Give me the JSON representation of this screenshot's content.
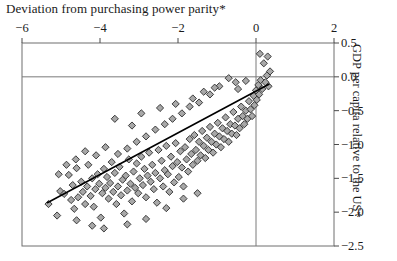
{
  "chart_data": {
    "type": "scatter",
    "title": "Deviation from purchasing power parity*",
    "xlabel": "Deviation from purchasing power parity*",
    "ylabel": "GDP per capita relative to the US*",
    "xlim": [
      -6,
      2
    ],
    "ylim": [
      -2.5,
      0.5
    ],
    "xticks": [
      -6,
      -4,
      -2,
      0,
      2
    ],
    "xtick_labels": [
      "−6",
      "−4",
      "−2",
      "0",
      "2"
    ],
    "yticks": [
      0.5,
      0.0,
      -0.5,
      -1.0,
      -1.5,
      -2.0,
      -2.5
    ],
    "ytick_labels": [
      "0.5",
      "0.0",
      "−0.5",
      "−1.0",
      "−1.5",
      "−2.0",
      "−2.5"
    ],
    "x_axis_position": "top",
    "y_axis_position": "right",
    "grid": "reference-lines-at-zero",
    "gridlines": {
      "horizontal": [
        0.0
      ],
      "vertical": [
        0.0
      ]
    },
    "legend": "none",
    "marker": {
      "shape": "diamond",
      "fill": "#a8a8a8",
      "edge": "#2b2b2b",
      "size": 6
    },
    "trendline": {
      "label": "fitted regression line",
      "color": "#000000",
      "width": 1.6,
      "x0": -5.35,
      "y0": -1.86,
      "x1": 0.33,
      "y1": -0.11
    },
    "series": [
      {
        "name": "countries",
        "points": [
          [
            -5.32,
            -1.88
          ],
          [
            -5.1,
            -2.05
          ],
          [
            -5.02,
            -1.69
          ],
          [
            -4.92,
            -1.73
          ],
          [
            -4.8,
            -1.45
          ],
          [
            -4.74,
            -1.82
          ],
          [
            -4.7,
            -1.6
          ],
          [
            -4.66,
            -1.95
          ],
          [
            -4.6,
            -1.35
          ],
          [
            -4.56,
            -1.78
          ],
          [
            -4.48,
            -1.55
          ],
          [
            -4.44,
            -1.7
          ],
          [
            -4.38,
            -1.88
          ],
          [
            -4.33,
            -1.62
          ],
          [
            -4.3,
            -1.3
          ],
          [
            -4.24,
            -1.76
          ],
          [
            -4.2,
            -1.5
          ],
          [
            -4.16,
            -1.92
          ],
          [
            -4.12,
            -1.66
          ],
          [
            -4.06,
            -1.44
          ],
          [
            -4.02,
            -1.58
          ],
          [
            -3.98,
            -2.08
          ],
          [
            -3.94,
            -1.72
          ],
          [
            -3.9,
            -1.36
          ],
          [
            -3.86,
            -1.64
          ],
          [
            -3.82,
            -1.48
          ],
          [
            -3.78,
            -1.8
          ],
          [
            -3.74,
            -1.57
          ],
          [
            -3.7,
            -1.26
          ],
          [
            -3.66,
            -1.7
          ],
          [
            -3.62,
            -1.42
          ],
          [
            -3.58,
            -1.88
          ],
          [
            -3.54,
            -1.62
          ],
          [
            -3.5,
            -1.33
          ],
          [
            -3.46,
            -1.75
          ],
          [
            -3.42,
            -1.52
          ],
          [
            -3.38,
            -2.02
          ],
          [
            -3.34,
            -1.46
          ],
          [
            -3.3,
            -1.68
          ],
          [
            -3.26,
            -1.22
          ],
          [
            -3.22,
            -1.58
          ],
          [
            -3.18,
            -1.84
          ],
          [
            -3.14,
            -1.4
          ],
          [
            -3.1,
            -1.64
          ],
          [
            -3.06,
            -1.28
          ],
          [
            -3.02,
            -1.72
          ],
          [
            -2.98,
            -1.5
          ],
          [
            -2.94,
            -1.18
          ],
          [
            -2.9,
            -1.6
          ],
          [
            -2.86,
            -1.36
          ],
          [
            -2.82,
            -1.78
          ],
          [
            -2.78,
            -1.46
          ],
          [
            -2.74,
            -1.12
          ],
          [
            -2.7,
            -1.55
          ],
          [
            -2.66,
            -1.3
          ],
          [
            -2.62,
            -1.66
          ],
          [
            -2.58,
            -1.42
          ],
          [
            -2.54,
            -1.86
          ],
          [
            -2.5,
            -1.08
          ],
          [
            -2.46,
            -1.5
          ],
          [
            -2.42,
            -1.24
          ],
          [
            -2.38,
            -1.62
          ],
          [
            -2.34,
            -1.38
          ],
          [
            -2.3,
            -1.02
          ],
          [
            -2.26,
            -1.44
          ],
          [
            -2.22,
            -1.7
          ],
          [
            -2.18,
            -1.18
          ],
          [
            -2.14,
            -1.32
          ],
          [
            -2.1,
            -1.56
          ],
          [
            -2.06,
            -0.98
          ],
          [
            -2.02,
            -1.26
          ],
          [
            -1.98,
            -1.48
          ],
          [
            -1.94,
            -1.1
          ],
          [
            -1.9,
            -1.34
          ],
          [
            -1.86,
            -1.62
          ],
          [
            -1.82,
            -1.04
          ],
          [
            -1.78,
            -1.22
          ],
          [
            -1.74,
            -1.4
          ],
          [
            -1.7,
            -0.92
          ],
          [
            -1.66,
            -1.14
          ],
          [
            -1.62,
            -1.3
          ],
          [
            -1.58,
            -0.86
          ],
          [
            -1.54,
            -1.08
          ],
          [
            -1.5,
            -1.24
          ],
          [
            -1.46,
            -0.96
          ],
          [
            -1.42,
            -1.16
          ],
          [
            -1.38,
            -0.8
          ],
          [
            -1.34,
            -1.02
          ],
          [
            -1.3,
            -1.2
          ],
          [
            -1.26,
            -0.9
          ],
          [
            -1.22,
            -1.08
          ],
          [
            -1.18,
            -0.74
          ],
          [
            -1.14,
            -0.96
          ],
          [
            -1.1,
            -1.12
          ],
          [
            -1.06,
            -0.84
          ],
          [
            -1.02,
            -1.0
          ],
          [
            -0.98,
            -0.68
          ],
          [
            -0.94,
            -0.88
          ],
          [
            -0.9,
            -1.04
          ],
          [
            -0.86,
            -0.76
          ],
          [
            -0.82,
            -0.92
          ],
          [
            -0.78,
            -0.6
          ],
          [
            -0.74,
            -0.8
          ],
          [
            -0.7,
            -0.96
          ],
          [
            -0.66,
            -0.7
          ],
          [
            -0.62,
            -0.84
          ],
          [
            -0.58,
            -0.52
          ],
          [
            -0.54,
            -0.72
          ],
          [
            -0.5,
            -0.86
          ],
          [
            -0.46,
            -0.62
          ],
          [
            -0.42,
            -0.76
          ],
          [
            -0.38,
            -0.44
          ],
          [
            -0.34,
            -0.58
          ],
          [
            -0.3,
            -0.7
          ],
          [
            -0.26,
            -0.5
          ],
          [
            -0.22,
            -0.62
          ],
          [
            -0.18,
            -0.36
          ],
          [
            -0.14,
            -0.48
          ],
          [
            -0.1,
            -0.58
          ],
          [
            -0.06,
            -0.28
          ],
          [
            -0.04,
            -0.42
          ],
          [
            0.0,
            -0.2
          ],
          [
            0.02,
            -0.34
          ],
          [
            0.06,
            -0.12
          ],
          [
            0.08,
            -0.26
          ],
          [
            0.12,
            -0.05
          ],
          [
            0.16,
            -0.18
          ],
          [
            0.2,
            0.2
          ],
          [
            0.24,
            -0.08
          ],
          [
            0.28,
            0.02
          ],
          [
            0.32,
            -0.14
          ],
          [
            0.36,
            0.08
          ],
          [
            -0.52,
            -0.08
          ],
          [
            -0.7,
            -0.02
          ],
          [
            -0.94,
            -0.14
          ],
          [
            -1.18,
            -0.26
          ],
          [
            -1.46,
            -0.38
          ],
          [
            -1.7,
            -0.44
          ],
          [
            -1.9,
            -0.54
          ],
          [
            -2.14,
            -0.62
          ],
          [
            -2.34,
            -0.7
          ],
          [
            -2.58,
            -0.78
          ],
          [
            -2.82,
            -0.88
          ],
          [
            -3.06,
            -0.96
          ],
          [
            -3.3,
            -1.06
          ],
          [
            -3.54,
            -1.14
          ],
          [
            -3.86,
            -1.04
          ],
          [
            -4.1,
            -1.16
          ],
          [
            -4.38,
            -1.1
          ],
          [
            -4.62,
            -1.22
          ],
          [
            -4.86,
            -1.3
          ],
          [
            -5.06,
            -1.44
          ],
          [
            -3.62,
            -0.62
          ],
          [
            -3.18,
            -0.72
          ],
          [
            -2.94,
            -0.54
          ],
          [
            -2.46,
            -0.46
          ],
          [
            -2.06,
            -0.4
          ],
          [
            -1.62,
            -0.32
          ],
          [
            -1.34,
            -0.22
          ],
          [
            -1.06,
            -0.16
          ],
          [
            -4.2,
            -2.2
          ],
          [
            -3.9,
            -2.24
          ],
          [
            -3.3,
            -2.18
          ],
          [
            -2.82,
            -2.1
          ],
          [
            -4.6,
            -2.12
          ],
          [
            -2.3,
            -1.94
          ],
          [
            -1.86,
            -1.8
          ],
          [
            -1.5,
            -1.72
          ],
          [
            -0.46,
            -0.18
          ],
          [
            -0.26,
            -0.06
          ],
          [
            0.1,
            0.34
          ],
          [
            0.3,
            0.3
          ]
        ]
      }
    ]
  }
}
